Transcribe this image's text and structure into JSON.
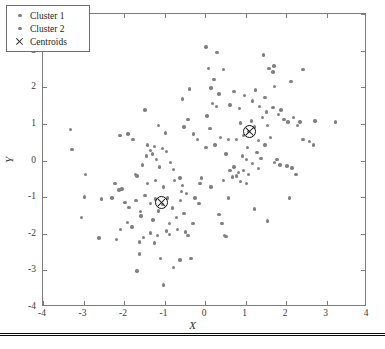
{
  "figure": {
    "background": "#ffffff",
    "point_color": "#808080",
    "centroid_color": "#121212",
    "axis_color": "#7d7d7d"
  },
  "axes": {
    "xlabel": "X",
    "ylabel": "Y",
    "xlim": [
      -4,
      4
    ],
    "ylim": [
      -4,
      4
    ],
    "xticks": [
      "-4",
      "-3",
      "-2",
      "-1",
      "0",
      "1",
      "2",
      "3",
      "4"
    ],
    "yticks": [
      "-4",
      "-3",
      "-2",
      "-1",
      "0",
      "1",
      "2",
      "3",
      "4"
    ],
    "grid": false
  },
  "legend": {
    "position": "upper-left",
    "items": [
      {
        "label": "Cluster 1",
        "marker": "dot",
        "color": "#808080"
      },
      {
        "label": "Cluster 2",
        "marker": "dot",
        "color": "#808080"
      },
      {
        "label": "Centroids",
        "marker": "x",
        "color": "#2c2c2c"
      }
    ]
  },
  "chart_data": {
    "type": "scatter",
    "title": "",
    "xlabel": "X",
    "ylabel": "Y",
    "xlim": [
      -4,
      4
    ],
    "ylim": [
      -4,
      4
    ],
    "xticks": [
      -4,
      -3,
      -2,
      -1,
      0,
      1,
      2,
      3,
      4
    ],
    "yticks": [
      -4,
      -3,
      -2,
      -1,
      0,
      1,
      2,
      3,
      4
    ],
    "grid": false,
    "legend_position": "upper-left",
    "marker_color": "#808080",
    "series": [
      {
        "name": "Cluster 1",
        "marker": "dot",
        "color": "#808080",
        "points": [
          [
            -1.05,
            -1.2
          ],
          [
            -1.22,
            -1.05
          ],
          [
            -0.92,
            -1.02
          ],
          [
            -1.15,
            -1.38
          ],
          [
            -0.8,
            -1.3
          ],
          [
            -1.35,
            -1.18
          ],
          [
            -0.7,
            -1.55
          ],
          [
            -1.48,
            -0.95
          ],
          [
            -1.02,
            -0.72
          ],
          [
            -0.6,
            -1.1
          ],
          [
            -1.28,
            -1.62
          ],
          [
            -0.88,
            -1.72
          ],
          [
            -1.6,
            -1.4
          ],
          [
            -0.52,
            -1.45
          ],
          [
            -1.18,
            -2.05
          ],
          [
            -0.95,
            -1.92
          ],
          [
            -1.7,
            -1.1
          ],
          [
            -0.45,
            -0.9
          ],
          [
            -1.42,
            -0.62
          ],
          [
            -0.75,
            -0.55
          ],
          [
            -2.05,
            -0.78
          ],
          [
            -2.12,
            -0.8
          ],
          [
            -2.3,
            -1.02
          ],
          [
            -2.55,
            -1.05
          ],
          [
            -2.98,
            -1.0
          ],
          [
            -3.05,
            -1.55
          ],
          [
            -2.62,
            -2.12
          ],
          [
            -2.18,
            -2.15
          ],
          [
            -2.08,
            -1.88
          ],
          [
            -1.92,
            -1.7
          ],
          [
            -1.8,
            -1.82
          ],
          [
            -1.62,
            -2.22
          ],
          [
            -1.52,
            -2.1
          ],
          [
            -1.35,
            -1.98
          ],
          [
            -1.25,
            -2.25
          ],
          [
            -1.58,
            -1.52
          ],
          [
            -1.88,
            -1.28
          ],
          [
            -1.98,
            -1.15
          ],
          [
            -2.22,
            -0.62
          ],
          [
            -2.1,
            0.68
          ],
          [
            -1.9,
            0.72
          ],
          [
            -1.68,
            -0.42
          ],
          [
            -1.72,
            -0.38
          ],
          [
            -1.55,
            -0.12
          ],
          [
            -1.45,
            0.12
          ],
          [
            -1.35,
            0.28
          ],
          [
            -1.25,
            0.38
          ],
          [
            -1.42,
            0.42
          ],
          [
            -1.3,
            0.18
          ],
          [
            -1.2,
            0.02
          ],
          [
            -1.12,
            -0.18
          ],
          [
            -1.05,
            0.32
          ],
          [
            -0.95,
            0.25
          ],
          [
            -0.85,
            -0.05
          ],
          [
            -0.78,
            -0.25
          ],
          [
            -1.48,
            1.38
          ],
          [
            -1.15,
            0.95
          ],
          [
            -0.98,
            0.75
          ],
          [
            -0.62,
            -0.48
          ],
          [
            -0.55,
            -0.68
          ],
          [
            -1.68,
            -3.02
          ],
          [
            -1.02,
            -3.4
          ],
          [
            -1.1,
            -2.68
          ],
          [
            -0.78,
            -2.92
          ],
          [
            -0.62,
            -2.72
          ],
          [
            -0.35,
            -2.68
          ],
          [
            -1.62,
            -2.55
          ],
          [
            -0.42,
            -2.05
          ],
          [
            -0.3,
            -1.72
          ],
          [
            -0.48,
            -1.95
          ],
          [
            -0.68,
            -1.88
          ],
          [
            -0.88,
            -2.02
          ],
          [
            -3.32,
            0.85
          ],
          [
            -3.28,
            0.3
          ],
          [
            -2.95,
            -0.38
          ],
          [
            -1.22,
            -0.55
          ],
          [
            -0.25,
            -1.02
          ],
          [
            -0.15,
            -1.18
          ],
          [
            -0.58,
            -0.85
          ],
          [
            -1.78,
            0.58
          ]
        ]
      },
      {
        "name": "Cluster 2",
        "marker": "dot",
        "color": "#808080",
        "points": [
          [
            1.08,
            0.8
          ],
          [
            1.22,
            0.92
          ],
          [
            0.95,
            0.68
          ],
          [
            1.32,
            0.55
          ],
          [
            1.15,
            1.08
          ],
          [
            0.88,
            1.02
          ],
          [
            1.42,
            1.18
          ],
          [
            1.55,
            0.95
          ],
          [
            1.05,
            0.35
          ],
          [
            1.28,
            0.22
          ],
          [
            0.92,
            0.12
          ],
          [
            1.48,
            0.42
          ],
          [
            1.62,
            0.62
          ],
          [
            0.78,
            0.58
          ],
          [
            1.35,
            1.48
          ],
          [
            1.18,
            1.62
          ],
          [
            1.52,
            1.32
          ],
          [
            1.68,
            1.45
          ],
          [
            1.82,
            1.25
          ],
          [
            1.95,
            1.12
          ],
          [
            2.05,
            1.05
          ],
          [
            1.88,
            1.38
          ],
          [
            2.18,
            1.18
          ],
          [
            2.42,
            2.48
          ],
          [
            2.12,
            2.15
          ],
          [
            1.72,
            2.02
          ],
          [
            1.45,
            2.88
          ],
          [
            1.58,
            2.52
          ],
          [
            1.68,
            2.42
          ],
          [
            1.7,
            2.58
          ],
          [
            1.25,
            1.92
          ],
          [
            0.98,
            1.78
          ],
          [
            0.85,
            1.42
          ],
          [
            0.62,
            1.52
          ],
          [
            0.45,
            2.48
          ],
          [
            0.3,
            2.95
          ],
          [
            0.02,
            3.1
          ],
          [
            0.08,
            2.52
          ],
          [
            0.22,
            2.22
          ],
          [
            0.15,
            1.98
          ],
          [
            0.35,
            1.82
          ],
          [
            0.18,
            1.55
          ],
          [
            0.28,
            1.48
          ],
          [
            0.05,
            1.22
          ],
          [
            0.12,
            0.88
          ],
          [
            0.38,
            0.62
          ],
          [
            0.25,
            0.42
          ],
          [
            0.02,
            0.35
          ],
          [
            -0.18,
            0.58
          ],
          [
            -0.28,
            0.72
          ],
          [
            -0.42,
            1.12
          ],
          [
            -0.52,
            0.92
          ],
          [
            -0.38,
            1.95
          ],
          [
            -0.55,
            1.68
          ],
          [
            0.58,
            0.58
          ],
          [
            0.72,
            -0.18
          ],
          [
            0.62,
            -0.28
          ],
          [
            0.82,
            -0.32
          ],
          [
            0.95,
            -0.28
          ],
          [
            0.78,
            -0.42
          ],
          [
            1.02,
            0.02
          ],
          [
            1.18,
            -0.08
          ],
          [
            1.32,
            -0.22
          ],
          [
            1.08,
            -0.38
          ],
          [
            1.72,
            -0.05
          ],
          [
            1.85,
            -0.12
          ],
          [
            1.78,
            0.02
          ],
          [
            2.02,
            -0.15
          ],
          [
            2.25,
            -0.38
          ],
          [
            2.15,
            -0.2
          ],
          [
            2.58,
            0.52
          ],
          [
            2.42,
            0.58
          ],
          [
            2.68,
            0.42
          ],
          [
            3.22,
            1.05
          ],
          [
            2.72,
            1.08
          ],
          [
            2.35,
            1.05
          ],
          [
            2.08,
            -1.02
          ],
          [
            1.55,
            -1.65
          ],
          [
            1.22,
            -1.32
          ],
          [
            0.88,
            -0.58
          ],
          [
            1.02,
            -0.62
          ],
          [
            0.58,
            -1.02
          ],
          [
            0.42,
            -1.72
          ],
          [
            0.35,
            -1.48
          ],
          [
            0.48,
            -2.05
          ],
          [
            0.52,
            -2.08
          ],
          [
            0.68,
            -0.45
          ],
          [
            0.45,
            -0.55
          ],
          [
            -0.08,
            -0.48
          ],
          [
            -0.12,
            -0.62
          ],
          [
            0.15,
            -0.72
          ],
          [
            1.48,
            1.72
          ],
          [
            1.38,
            0.05
          ],
          [
            0.72,
            1.88
          ],
          [
            0.52,
            0.18
          ],
          [
            2.28,
            0.95
          ]
        ]
      }
    ],
    "centroids": {
      "name": "Centroids",
      "marker": "circle-x",
      "color": "#121212",
      "points": [
        [
          -1.08,
          -1.15
        ],
        [
          1.1,
          0.78
        ]
      ]
    }
  }
}
